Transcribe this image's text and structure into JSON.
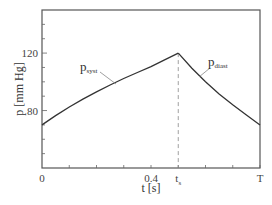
{
  "chart_data": {
    "type": "line",
    "title": "",
    "xlabel": "t [s]",
    "ylabel": "p [mm Hg]",
    "xlim": [
      0,
      0.8
    ],
    "ylim": [
      40,
      150
    ],
    "x_ticks": [
      {
        "value": 0,
        "label": "0"
      },
      {
        "value": 0.4,
        "label": "0.4"
      },
      {
        "value": 0.5,
        "label": "t",
        "sub": "s"
      },
      {
        "value": 0.8,
        "label": "T"
      }
    ],
    "y_ticks": [
      {
        "value": 80,
        "label": "80"
      },
      {
        "value": 120,
        "label": "120"
      }
    ],
    "grid": false,
    "series": [
      {
        "name": "p_syst",
        "label": "p",
        "label_sub": "syst",
        "x": [
          0,
          0.05,
          0.1,
          0.15,
          0.2,
          0.25,
          0.3,
          0.35,
          0.4,
          0.45,
          0.5
        ],
        "values": [
          70,
          76.5,
          82.5,
          88,
          93,
          97.8,
          102.3,
          106.5,
          110.5,
          115.3,
          120
        ]
      },
      {
        "name": "p_diast",
        "label": "p",
        "label_sub": "diast",
        "x": [
          0.5,
          0.55,
          0.6,
          0.65,
          0.7,
          0.75,
          0.8
        ],
        "values": [
          120,
          109.5,
          100,
          91.5,
          84,
          77,
          70
        ]
      }
    ],
    "annotations": [
      {
        "type": "vline",
        "x": 0.5,
        "style": "dashed",
        "from_y": 40,
        "to_y": 120
      }
    ],
    "colors": {
      "line": "#333333",
      "axis": "#555555",
      "dashed": "#888888"
    }
  }
}
